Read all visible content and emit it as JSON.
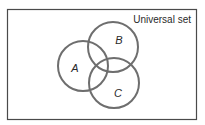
{
  "diagram": {
    "type": "venn",
    "universal_label": "Universal set",
    "sets": [
      {
        "label": "A",
        "cx": 83,
        "cy": 66,
        "r": 25
      },
      {
        "label": "B",
        "cx": 113,
        "cy": 47,
        "r": 25
      },
      {
        "label": "C",
        "cx": 114,
        "cy": 83,
        "r": 25
      }
    ],
    "colors": {
      "circle_stroke": "#6e6e6e",
      "frame_stroke": "#4a4a4a",
      "text": "#2a2a2a"
    }
  }
}
